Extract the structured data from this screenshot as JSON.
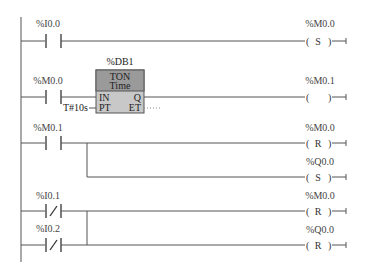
{
  "diagram": {
    "type": "ladder-logic",
    "rungs": [
      {
        "id": "rung-1",
        "contacts": [
          {
            "address": "%I0.0",
            "type": "NO"
          }
        ],
        "coils": [
          {
            "address": "%M0.0",
            "type": "S",
            "symbol": "S"
          }
        ]
      },
      {
        "id": "rung-2",
        "contacts": [
          {
            "address": "%M0.0",
            "type": "NO"
          }
        ],
        "timer": {
          "instance": "%DB1",
          "type": "TON",
          "subtype": "Time",
          "pin_in": "IN",
          "pin_pt": "PT",
          "pin_q": "Q",
          "pin_et": "ET",
          "pt_value": "T#10s",
          "et_value": "..."
        },
        "coils": [
          {
            "address": "%M0.1",
            "type": "normal",
            "symbol": ""
          }
        ]
      },
      {
        "id": "rung-3",
        "contacts": [
          {
            "address": "%M0.1",
            "type": "NO"
          }
        ],
        "coils": [
          {
            "address": "%M0.0",
            "type": "R",
            "symbol": "R"
          },
          {
            "address": "%Q0.0",
            "type": "S",
            "symbol": "S"
          }
        ]
      },
      {
        "id": "rung-4",
        "contacts": [
          {
            "address": "%I0.1",
            "type": "NC"
          },
          {
            "address": "%I0.2",
            "type": "NC"
          }
        ],
        "coils": [
          {
            "address": "%M0.0",
            "type": "R",
            "symbol": "R"
          },
          {
            "address": "%Q0.0",
            "type": "R",
            "symbol": "R"
          }
        ]
      }
    ]
  },
  "colors": {
    "background": "#ffffff",
    "line": "#555555",
    "timer_header": "#9a9a9a",
    "timer_body": "#c8c8c8"
  }
}
